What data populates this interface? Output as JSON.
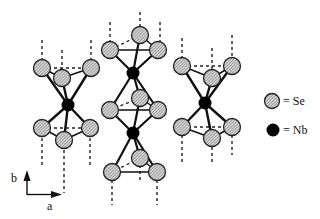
{
  "figure": {
    "legend": {
      "se": {
        "label": "= Se",
        "symbol": "hatched-gray-circle"
      },
      "nb": {
        "label": "= Nb",
        "symbol": "solid-black-circle"
      }
    },
    "axes": {
      "b": {
        "label": "b"
      },
      "a": {
        "label": "a"
      }
    },
    "colors": {
      "se_fill": "#b8b8b8",
      "se_stroke": "#222222",
      "nb_fill": "#000000",
      "bond": "#111111",
      "dashed": "#222222"
    }
  },
  "clusters": [
    {
      "name": "left-prism",
      "nb": [
        [
          68,
          105
        ]
      ],
      "se_top": [
        [
          42,
          68
        ],
        [
          91,
          68
        ],
        [
          62,
          78
        ]
      ],
      "se_bottom": [
        [
          42,
          128
        ],
        [
          90,
          128
        ],
        [
          64,
          140
        ]
      ],
      "verticals": [
        [
          42,
          40,
          62
        ],
        [
          42,
          138,
          165
        ],
        [
          62,
          50,
          78
        ],
        [
          64,
          150,
          193
        ],
        [
          91,
          40,
          62
        ],
        [
          90,
          138,
          165
        ]
      ]
    },
    {
      "name": "center-prism",
      "nb": [
        [
          133,
          73
        ],
        [
          133,
          133
        ]
      ],
      "se_top": [
        [
          140,
          35
        ],
        [
          110,
          50
        ],
        [
          158,
          50
        ]
      ],
      "se_mid": [
        [
          140,
          98
        ],
        [
          110,
          110
        ],
        [
          158,
          110
        ]
      ],
      "se_bottom": [
        [
          140,
          158
        ],
        [
          112,
          172
        ],
        [
          157,
          172
        ]
      ],
      "verticals": [
        [
          140,
          12,
          27
        ],
        [
          110,
          22,
          43
        ],
        [
          160,
          22,
          43
        ],
        [
          140,
          165,
          180
        ],
        [
          112,
          180,
          205
        ],
        [
          157,
          180,
          205
        ]
      ]
    },
    {
      "name": "right-prism",
      "nb": [
        [
          205,
          103
        ]
      ],
      "se_top": [
        [
          182,
          66
        ],
        [
          232,
          66
        ],
        [
          212,
          78
        ]
      ],
      "se_bottom": [
        [
          182,
          127
        ],
        [
          232,
          127
        ],
        [
          212,
          138
        ]
      ],
      "verticals": [
        [
          182,
          38,
          58
        ],
        [
          212,
          48,
          70
        ],
        [
          232,
          35,
          58
        ],
        [
          182,
          135,
          165
        ],
        [
          212,
          147,
          165
        ],
        [
          232,
          135,
          155
        ]
      ]
    }
  ]
}
